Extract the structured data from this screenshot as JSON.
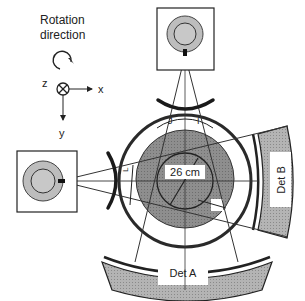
{
  "legend": {
    "rotation_line1": "Rotation",
    "rotation_line2": "direction",
    "axis_z": "z",
    "axis_x": "x",
    "axis_y": "y"
  },
  "labels": {
    "diameter": "26 cm",
    "det_a": "Det A",
    "det_b": "Det B",
    "j": "J",
    "i": "I",
    "l": "L"
  },
  "colors": {
    "stroke": "#2a2a2a",
    "phantom_fill": "#8c8c8c",
    "detector_fill": "#a9a9a9",
    "source_fill": "#bdbdbd",
    "background": "#ffffff"
  }
}
